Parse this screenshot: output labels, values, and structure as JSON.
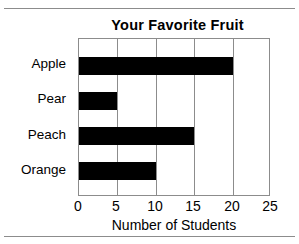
{
  "figure": {
    "background_color": "#ffffff",
    "rule_color": "#8c8c8c",
    "frame_color": "#8c8c8c",
    "bar_color": "#000000"
  },
  "chart_data": {
    "type": "bar",
    "orientation": "horizontal",
    "title": "Your Favorite Fruit",
    "xlabel": "Number of Students",
    "ylabel": "",
    "categories": [
      "Apple",
      "Pear",
      "Peach",
      "Orange"
    ],
    "values": [
      20,
      5,
      15,
      10
    ],
    "xlim": [
      0,
      25
    ],
    "xticks": [
      0,
      5,
      10,
      15,
      20,
      25
    ],
    "xtick_labels": [
      "0",
      "5",
      "10",
      "15",
      "20",
      "25"
    ],
    "grid": "vertical",
    "legend": "none",
    "bar_color": "#000000"
  }
}
